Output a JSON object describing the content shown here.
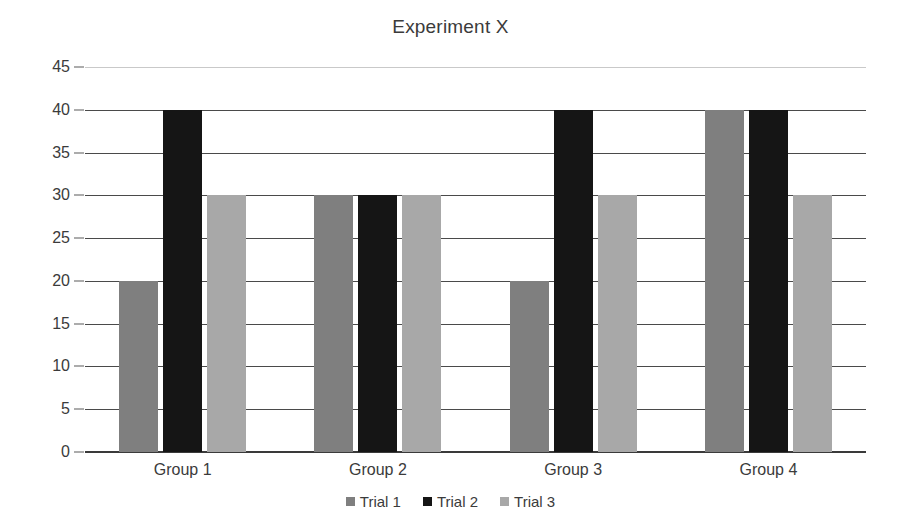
{
  "chart_data": {
    "type": "bar",
    "title": "Experiment X",
    "subtitle": "",
    "xlabel": "",
    "ylabel": "",
    "categories": [
      "Group 1",
      "Group 2",
      "Group 3",
      "Group 4"
    ],
    "series": [
      {
        "name": "Trial 1",
        "color": "#7f7f7f",
        "values": [
          20,
          30,
          20,
          40
        ]
      },
      {
        "name": "Trial 2",
        "color": "#151515",
        "values": [
          40,
          30,
          40,
          40
        ]
      },
      {
        "name": "Trial 3",
        "color": "#a8a8a8",
        "values": [
          30,
          30,
          30,
          30
        ]
      }
    ],
    "ylim": [
      0,
      45
    ],
    "ytick_step": 5,
    "yticks": [
      0,
      5,
      10,
      15,
      20,
      25,
      30,
      35,
      40,
      45
    ],
    "ytick_labels": [
      "0",
      "5",
      "10",
      "15",
      "20",
      "25",
      "30",
      "35",
      "40",
      "45"
    ],
    "grid": true,
    "grid_axis": "y",
    "legend_position": "bottom",
    "legend": [
      "Trial 1",
      "Trial 2",
      "Trial 3"
    ]
  },
  "colors": {
    "background": "#ffffff",
    "text": "#3b3b3b",
    "gridline": "#4a4a4a",
    "gridline_faint": "#c9c9c9",
    "axis": "#3a3a3a",
    "trial_1": "#7f7f7f",
    "trial_2": "#151515",
    "trial_3": "#a8a8a8"
  }
}
